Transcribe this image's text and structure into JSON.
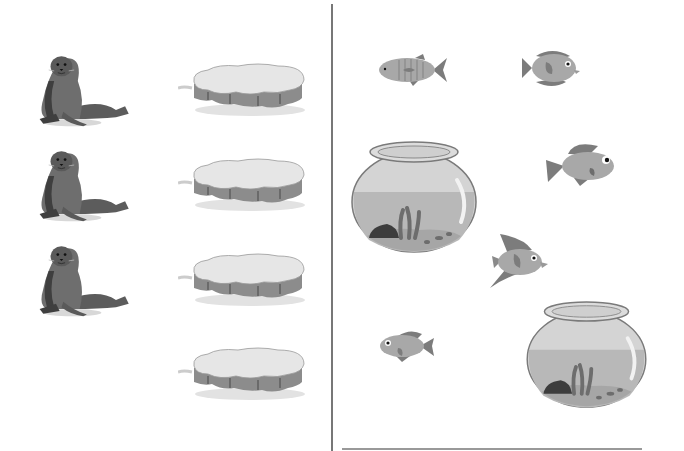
{
  "worksheet": {
    "left_panel": {
      "seals": [
        {
          "id": "seal-1",
          "x": 36,
          "y": 53
        },
        {
          "id": "seal-2",
          "x": 36,
          "y": 148
        },
        {
          "id": "seal-3",
          "x": 36,
          "y": 243
        }
      ],
      "ice_floes": [
        {
          "id": "ice-1",
          "x": 178,
          "y": 65
        },
        {
          "id": "ice-2",
          "x": 178,
          "y": 160
        },
        {
          "id": "ice-3",
          "x": 178,
          "y": 255
        },
        {
          "id": "ice-4",
          "x": 178,
          "y": 349
        }
      ]
    },
    "right_panel": {
      "fish": [
        {
          "id": "fish-1",
          "kind": "striped",
          "x": 375,
          "y": 52
        },
        {
          "id": "fish-2",
          "kind": "tang",
          "x": 518,
          "y": 48
        },
        {
          "id": "fish-3",
          "kind": "cichlid",
          "x": 544,
          "y": 140
        },
        {
          "id": "fish-4",
          "kind": "angelfish",
          "x": 488,
          "y": 232
        },
        {
          "id": "fish-5",
          "kind": "small",
          "x": 376,
          "y": 330
        }
      ],
      "fishbowls": [
        {
          "id": "bowl-1",
          "x": 349,
          "y": 140
        },
        {
          "id": "bowl-2",
          "x": 524,
          "y": 300
        }
      ]
    },
    "colors": {
      "background": "#ffffff",
      "divider": "#777777",
      "seal_body": "#6e6e6e",
      "seal_dark": "#3f3f3f",
      "ice_top": "#e6e6e6",
      "ice_side": "#8c8c8c",
      "fish_body": "#a8a8a8",
      "fish_fin": "#7c7c7c",
      "bowl_glass": "#d4d4d4",
      "bowl_water": "#b8b8b8"
    }
  }
}
